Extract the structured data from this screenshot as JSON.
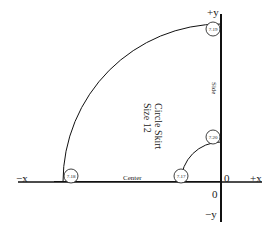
{
  "diagram": {
    "title": "Circle Skirt",
    "subtitle": "Size 12",
    "axes": {
      "pos_y": "+y",
      "neg_y": "−y",
      "pos_x": "+x",
      "neg_x": "−x",
      "origin_x": "0",
      "origin_y": "0"
    },
    "edge_labels": {
      "center": "Center",
      "side": "Side"
    },
    "points": [
      {
        "id": "7.19",
        "position": "top of outer arc on +y axis"
      },
      {
        "id": "7.20",
        "position": "top of inner arc on +y axis"
      },
      {
        "id": "7.17",
        "position": "inner arc on x axis"
      },
      {
        "id": "7.18",
        "position": "outer arc on x axis"
      }
    ],
    "colors": {
      "line": "#111111",
      "text": "#222222",
      "background": "#ffffff"
    }
  }
}
